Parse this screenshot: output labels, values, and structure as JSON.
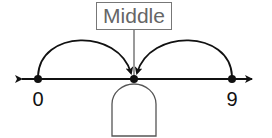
{
  "diagram": {
    "type": "number-line",
    "callout_label": "Middle",
    "points": [
      {
        "label": "0",
        "value": 0
      },
      {
        "label": "",
        "value": 4.5,
        "note": "midpoint (blank answer box below)"
      },
      {
        "label": "9",
        "value": 9
      }
    ],
    "answer_box": {
      "value": ""
    },
    "colors": {
      "line": "#111111",
      "box_border": "#777777",
      "callout_text": "#666666"
    }
  }
}
